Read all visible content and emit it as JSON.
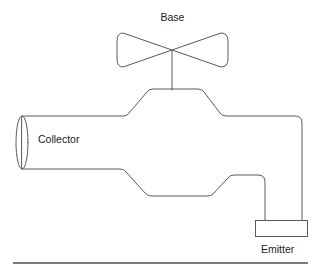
{
  "diagram": {
    "background_color": "#ffffff",
    "line_color": "#5a5a5a",
    "text_color": "#1a1a1a",
    "baseline_color": "#4d4d4d",
    "labels": {
      "base": "Base",
      "collector": "Collector",
      "emitter": "Emitter"
    },
    "parts": [
      {
        "name": "handle",
        "label": "Base",
        "shape": "bowtie-valve-handle",
        "description": "Two opposing triangular wings meeting at a center point atop a vertical stem"
      },
      {
        "name": "inlet-pipe",
        "label": "Collector",
        "shape": "horizontal-cylinder",
        "description": "Open-ended cylinder entering the valve body from the left"
      },
      {
        "name": "outlet-spout",
        "label": "Emitter",
        "shape": "downturned-spout-with-flange",
        "description": "Pipe bending downward on the right ending in a rectangular flange"
      }
    ],
    "geometry": {
      "handle": {
        "center_x": 172,
        "center_y": 50,
        "left_tip_x": 117,
        "right_tip_x": 228,
        "wing_half_height": 15
      },
      "stem": {
        "x": 172,
        "top_y": 50,
        "bottom_y": 90
      },
      "collector_ellipse": {
        "cx": 22,
        "cy": 142,
        "rx": 6,
        "ry": 26
      },
      "body_top_plateau": {
        "x1": 153,
        "x2": 200,
        "y": 89
      },
      "body_bottom_plateau": {
        "x1": 150,
        "x2": 200,
        "y": 196
      },
      "spout_outer_x": 302,
      "spout_inner_x": 265,
      "emitter_box": {
        "x": 255,
        "y": 220,
        "width": 53,
        "height": 17
      },
      "baseline": {
        "x1": 13,
        "x2": 308,
        "y": 263
      }
    }
  }
}
